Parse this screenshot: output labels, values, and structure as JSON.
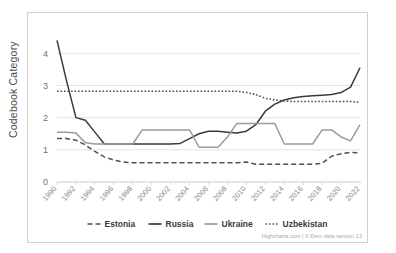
{
  "chart": {
    "type": "line",
    "title": "",
    "credits": "Highcharts.com  |  V-Dem data version 13",
    "background": "#ffffff",
    "border_color": "#d0d0d0"
  },
  "yaxis": {
    "label": "Codebook Category",
    "ticks": [
      "0",
      "1",
      "2",
      "3",
      "4"
    ],
    "min": 0,
    "max": 4.6,
    "grid": true
  },
  "xaxis": {
    "label": "",
    "ticks": [
      "1990",
      "1992",
      "1994",
      "1996",
      "1998",
      "2000",
      "2002",
      "2004",
      "2006",
      "2008",
      "2010",
      "2012",
      "2014",
      "2016",
      "2018",
      "2020",
      "2022"
    ],
    "min": 1990,
    "max": 2022
  },
  "legend": {
    "position": "bottom",
    "items": [
      {
        "label": "Estonia",
        "color": "#4f4f4f",
        "dash": "dashed",
        "marker": "- -"
      },
      {
        "label": "Russia",
        "color": "#3a3a3a",
        "dash": "solid",
        "marker": "—"
      },
      {
        "label": "Ukraine",
        "color": "#9a9a9a",
        "dash": "solid",
        "marker": "—"
      },
      {
        "label": "Uzbekistan",
        "color": "#4f4f4f",
        "dash": "dotted",
        "marker": "···"
      }
    ]
  },
  "chart_data": {
    "type": "line",
    "title": "",
    "xlabel": "",
    "ylabel": "Codebook Category",
    "ylim": [
      0,
      4.6
    ],
    "xlim": [
      1990,
      2022
    ],
    "grid": true,
    "legend_position": "bottom",
    "x": [
      1990,
      1991,
      1992,
      1993,
      1994,
      1995,
      1996,
      1997,
      1998,
      1999,
      2000,
      2001,
      2002,
      2003,
      2004,
      2005,
      2006,
      2007,
      2008,
      2009,
      2010,
      2011,
      2012,
      2013,
      2014,
      2015,
      2016,
      2017,
      2018,
      2019,
      2020,
      2021,
      2022
    ],
    "series": [
      {
        "name": "Estonia",
        "color": "#4f4f4f",
        "dash": "dashed",
        "values": [
          1.35,
          1.35,
          1.3,
          1.15,
          0.95,
          0.78,
          0.68,
          0.62,
          0.6,
          0.6,
          0.6,
          0.6,
          0.6,
          0.6,
          0.6,
          0.6,
          0.6,
          0.6,
          0.6,
          0.6,
          0.62,
          0.55,
          0.55,
          0.55,
          0.55,
          0.55,
          0.55,
          0.55,
          0.58,
          0.8,
          0.88,
          0.92,
          0.9
        ]
      },
      {
        "name": "Russia",
        "color": "#3a3a3a",
        "dash": "solid",
        "values": [
          4.4,
          3.15,
          2.0,
          1.92,
          1.55,
          1.18,
          1.18,
          1.18,
          1.18,
          1.18,
          1.18,
          1.18,
          1.18,
          1.2,
          1.35,
          1.5,
          1.58,
          1.58,
          1.55,
          1.52,
          1.58,
          1.78,
          2.2,
          2.42,
          2.55,
          2.62,
          2.66,
          2.68,
          2.7,
          2.72,
          2.78,
          2.95,
          3.55
        ]
      },
      {
        "name": "Ukraine",
        "color": "#9a9a9a",
        "dash": "solid",
        "values": [
          1.55,
          1.55,
          1.52,
          1.22,
          1.18,
          1.18,
          1.18,
          1.18,
          1.18,
          1.62,
          1.62,
          1.62,
          1.62,
          1.62,
          1.62,
          1.08,
          1.08,
          1.08,
          1.4,
          1.82,
          1.82,
          1.82,
          1.82,
          1.82,
          1.18,
          1.18,
          1.18,
          1.18,
          1.62,
          1.62,
          1.4,
          1.28,
          1.78
        ]
      },
      {
        "name": "Uzbekistan",
        "color": "#4f4f4f",
        "dash": "dotted",
        "values": [
          2.82,
          2.82,
          2.82,
          2.82,
          2.82,
          2.82,
          2.82,
          2.82,
          2.82,
          2.82,
          2.82,
          2.82,
          2.82,
          2.82,
          2.82,
          2.82,
          2.82,
          2.82,
          2.82,
          2.82,
          2.78,
          2.72,
          2.6,
          2.55,
          2.52,
          2.5,
          2.5,
          2.5,
          2.5,
          2.5,
          2.5,
          2.5,
          2.48
        ]
      }
    ]
  }
}
